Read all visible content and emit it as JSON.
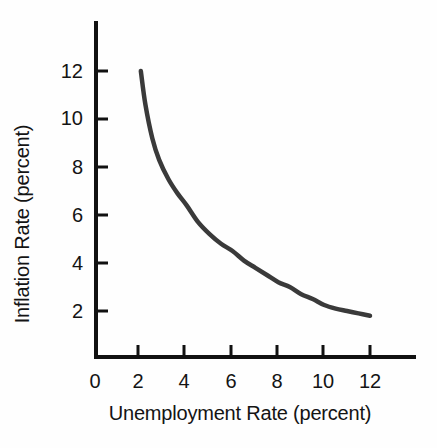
{
  "chart_data": {
    "type": "line",
    "title": "",
    "xlabel": "Unemployment Rate (percent)",
    "ylabel": "Inflation Rate (percent)",
    "xlim": [
      0,
      13.5
    ],
    "ylim": [
      0,
      13.8
    ],
    "xticks": [
      "0",
      "2",
      "4",
      "6",
      "8",
      "10",
      "12"
    ],
    "xtick_values": [
      0,
      2,
      4,
      6,
      8,
      10,
      12
    ],
    "yticks": [
      "2",
      "4",
      "6",
      "8",
      "10",
      "12"
    ],
    "ytick_values": [
      2,
      4,
      6,
      8,
      10,
      12
    ],
    "grid": false,
    "legend": "none",
    "series": [
      {
        "name": "Phillips Curve",
        "color": "#3a3a3a",
        "x": [
          2.0,
          2.2,
          2.5,
          2.8,
          3.2,
          3.6,
          4.0,
          4.5,
          5.0,
          5.5,
          6.0,
          6.5,
          7.0,
          7.5,
          8.0,
          8.5,
          9.0,
          9.5,
          10.0,
          10.5,
          11.0,
          11.5,
          12.0
        ],
        "y": [
          12.0,
          10.6,
          9.2,
          8.3,
          7.5,
          6.9,
          6.4,
          5.7,
          5.2,
          4.8,
          4.5,
          4.1,
          3.8,
          3.5,
          3.2,
          3.0,
          2.7,
          2.5,
          2.25,
          2.1,
          2.0,
          1.9,
          1.8
        ]
      }
    ]
  },
  "axes": {
    "x_axis_name": "unemployment-rate-axis",
    "y_axis_name": "inflation-rate-axis"
  }
}
